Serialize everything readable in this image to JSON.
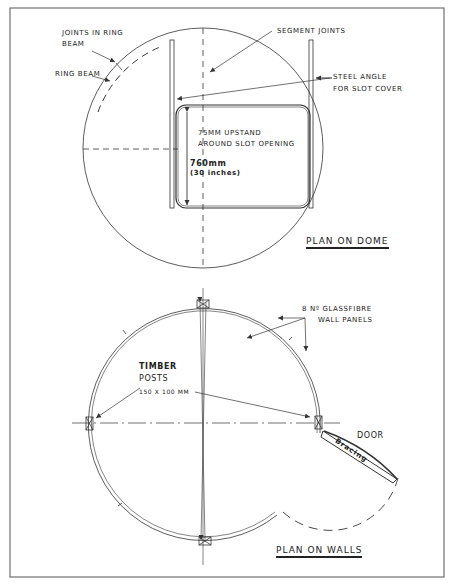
{
  "drawing": {
    "colors": {
      "ink": "#333333",
      "paper": "#ffffff"
    },
    "plan_dome": {
      "title": "Plan on Dome",
      "labels": {
        "joints_in_ring_beam_line1": "Joints in Ring",
        "joints_in_ring_beam_line2": "Beam",
        "ring_beam": "Ring Beam",
        "segment_joints": "Segment Joints",
        "steel_angle_line1": "Steel Angle",
        "steel_angle_line2": "For Slot Cover",
        "upstand_line1": "75mm Upstand",
        "upstand_line2": "Around Slot Opening",
        "dimension_line1": "760mm",
        "dimension_line2": "(30 inches)"
      }
    },
    "plan_walls": {
      "title": "Plan on Walls",
      "labels": {
        "panels_line1": "8 Nº Glassfibre",
        "panels_line2": "Wall Panels",
        "timber_line1": "Timber",
        "timber_line2": "Posts",
        "timber_line3": "150 x 100 MM",
        "door": "Door",
        "bracing": "Bracing"
      }
    }
  }
}
